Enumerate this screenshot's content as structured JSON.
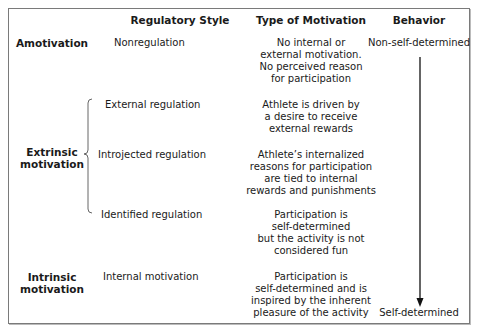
{
  "headers": {
    "regulatory_style": "Regulatory Style",
    "type_of_motivation": "Type  of Motivation",
    "behavior": "Behavior"
  },
  "categories": {
    "amotivation": "Amotivation",
    "extrinsic_line1": "Extrinsic",
    "extrinsic_line2": "motivation",
    "intrinsic_line1": "Intrinsic",
    "intrinsic_line2": "motivation"
  },
  "rows": [
    {
      "style": "Nonregulation",
      "motivation": "No internal or\nexternal motivation.\nNo perceived reason\nfor participation"
    },
    {
      "style": "External regulation",
      "motivation": "Athlete is driven by\na desire to receive\nexternal rewards"
    },
    {
      "style": "Introjected regulation",
      "motivation": "Athlete’s internalized\nreasons for participation\nare tied to internal\nrewards and punishments"
    },
    {
      "style": "Identified regulation",
      "motivation": "Participation is\nself-determined\nbut the activity is not\nconsidered fun"
    },
    {
      "style": "Internal motivation",
      "motivation": "Participation is\nself-determined and is\ninspired by the inherent\npleasure of the activity"
    }
  ],
  "behavior": {
    "top_label": "Non-self-determined",
    "bottom_label": "Self-determined",
    "arrow": "down-arrow"
  },
  "colors": {
    "border": "#7a7a7a",
    "text": "#1a1a1a"
  }
}
